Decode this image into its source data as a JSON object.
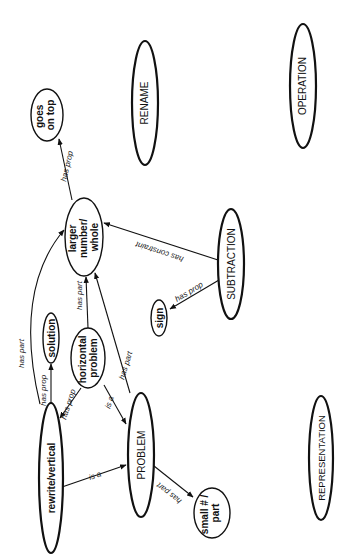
{
  "diagram": {
    "orientation": "rotated 90 degrees clockwise (text reads bottom-to-top)",
    "nodes": {
      "goes_on_top": {
        "lines": [
          "goes",
          "on top"
        ]
      },
      "rename": {
        "label": "RENAME"
      },
      "operation": {
        "label": "OPERATION"
      },
      "larger_number": {
        "lines": [
          "larger",
          "number/",
          "whole"
        ]
      },
      "solution": {
        "label": "solution"
      },
      "horizontal_problem": {
        "lines": [
          "horizontal",
          "problem"
        ]
      },
      "sign": {
        "label": "sign"
      },
      "subtraction": {
        "label": "SUBTRACTION"
      },
      "rewrite_vertical": {
        "label": "rewrite/vertical"
      },
      "problem": {
        "label": "PROBLEM"
      },
      "small_part": {
        "lines": [
          "small # /",
          "part"
        ]
      },
      "representation": {
        "label": "REPRESENTATION"
      }
    },
    "edges": [
      {
        "from": "larger number/whole",
        "to": "goes on top",
        "label": "has prop"
      },
      {
        "from": "SUBTRACTION",
        "to": "larger number/whole",
        "label": "has constraint"
      },
      {
        "from": "SUBTRACTION",
        "to": "sign",
        "label": "has prop"
      },
      {
        "from": "rewrite/vertical",
        "to": "larger number/whole",
        "label": "has part"
      },
      {
        "from": "horizontal problem",
        "to": "larger number/whole",
        "label": "has part"
      },
      {
        "from": "PROBLEM",
        "to": "larger number/whole",
        "label": "has part"
      },
      {
        "from": "rewrite/vertical",
        "to": "solution",
        "label": "has prop"
      },
      {
        "from": "horizontal problem",
        "to": "rewrite/vertical",
        "label": "has prop"
      },
      {
        "from": "horizontal problem",
        "to": "PROBLEM",
        "label": "is a"
      },
      {
        "from": "rewrite/vertical",
        "to": "PROBLEM",
        "label": "is a"
      },
      {
        "from": "PROBLEM",
        "to": "small # / part",
        "label": "has part"
      }
    ],
    "edge_labels": {
      "has_prop": "has prop",
      "has_part": "has part",
      "has_constraint": "has constraint",
      "is_a": "is a"
    }
  }
}
